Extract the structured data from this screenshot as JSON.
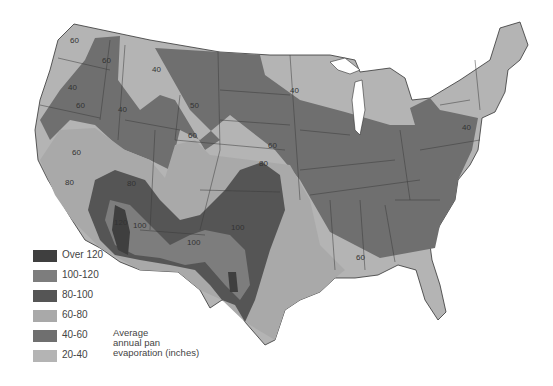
{
  "map": {
    "title": "Average annual pan evaporation (inches)",
    "title_lines": [
      "Average",
      "annual pan",
      "evaporation (inches)"
    ],
    "region": "Contiguous United States"
  },
  "legend": {
    "items": [
      {
        "label": "Over 120",
        "color": "#3f3f3f"
      },
      {
        "label": "100-120",
        "color": "#7d7d7d"
      },
      {
        "label": "80-100",
        "color": "#555555"
      },
      {
        "label": "60-80",
        "color": "#a9a9a9"
      },
      {
        "label": "40-60",
        "color": "#6f6f6f"
      },
      {
        "label": "20-40",
        "color": "#b4b4b4"
      }
    ]
  },
  "contour_labels": [
    {
      "text": "60",
      "x": 70,
      "y": 43
    },
    {
      "text": "60",
      "x": 102,
      "y": 63
    },
    {
      "text": "40",
      "x": 68,
      "y": 90
    },
    {
      "text": "60",
      "x": 76,
      "y": 108
    },
    {
      "text": "40",
      "x": 118,
      "y": 112
    },
    {
      "text": "40",
      "x": 152,
      "y": 72
    },
    {
      "text": "50",
      "x": 190,
      "y": 108
    },
    {
      "text": "60",
      "x": 188,
      "y": 138
    },
    {
      "text": "40",
      "x": 290,
      "y": 93
    },
    {
      "text": "60",
      "x": 268,
      "y": 148
    },
    {
      "text": "80",
      "x": 259,
      "y": 166
    },
    {
      "text": "60",
      "x": 72,
      "y": 155
    },
    {
      "text": "80",
      "x": 65,
      "y": 185
    },
    {
      "text": "80",
      "x": 127,
      "y": 186
    },
    {
      "text": "120",
      "x": 114,
      "y": 225
    },
    {
      "text": "100",
      "x": 133,
      "y": 228
    },
    {
      "text": "100",
      "x": 187,
      "y": 245
    },
    {
      "text": "100",
      "x": 231,
      "y": 230
    },
    {
      "text": "120",
      "x": 235,
      "y": 280
    },
    {
      "text": "60",
      "x": 356,
      "y": 260
    },
    {
      "text": "40",
      "x": 462,
      "y": 130
    },
    {
      "text": "60",
      "x": 356,
      "y": 258
    }
  ]
}
